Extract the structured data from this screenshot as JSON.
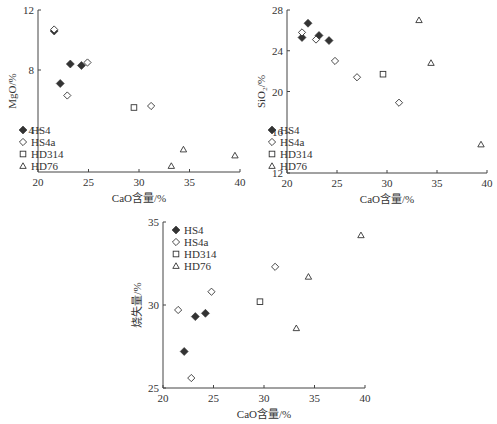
{
  "chart_data": [
    {
      "type": "scatter",
      "id": "mgo",
      "xlabel": "CaO含量/%",
      "ylabel": "MgO/%",
      "xlim": [
        20,
        40
      ],
      "ylim": [
        1.2,
        12
      ],
      "xticks": [
        20,
        25,
        30,
        35,
        40
      ],
      "yticks": [
        4,
        8,
        12
      ],
      "legend_position": "lower-left",
      "series": [
        {
          "name": "HS4",
          "marker": "filled-diamond",
          "points": [
            [
              21.6,
              10.6
            ],
            [
              22.2,
              7.1
            ],
            [
              23.2,
              8.4
            ],
            [
              24.3,
              8.3
            ]
          ]
        },
        {
          "name": "HS4a",
          "marker": "open-diamond",
          "points": [
            [
              21.6,
              10.7
            ],
            [
              22.9,
              6.3
            ],
            [
              24.9,
              8.5
            ],
            [
              31.2,
              5.6
            ]
          ]
        },
        {
          "name": "HD314",
          "marker": "open-square",
          "points": [
            [
              29.5,
              5.5
            ]
          ]
        },
        {
          "name": "HD76",
          "marker": "open-triangle",
          "points": [
            [
              33.2,
              1.6
            ],
            [
              34.4,
              2.7
            ],
            [
              39.5,
              2.3
            ]
          ]
        }
      ]
    },
    {
      "type": "scatter",
      "id": "sio2",
      "xlabel": "CaO含量/%",
      "ylabel": "SiO₂/%",
      "xlim": [
        20,
        40
      ],
      "ylim": [
        12,
        28
      ],
      "xticks": [
        20,
        25,
        30,
        35,
        40
      ],
      "yticks": [
        12,
        16,
        20,
        24,
        28
      ],
      "legend_position": "lower-left",
      "series": [
        {
          "name": "HS4",
          "marker": "filled-diamond",
          "points": [
            [
              21.5,
              25.3
            ],
            [
              22.1,
              26.7
            ],
            [
              23.2,
              25.5
            ],
            [
              24.2,
              25.0
            ]
          ]
        },
        {
          "name": "HS4a",
          "marker": "open-diamond",
          "points": [
            [
              21.5,
              25.8
            ],
            [
              22.9,
              25.1
            ],
            [
              24.8,
              23.0
            ],
            [
              27.0,
              21.4
            ],
            [
              31.2,
              18.9
            ]
          ]
        },
        {
          "name": "HD314",
          "marker": "open-square",
          "points": [
            [
              29.6,
              21.7
            ]
          ]
        },
        {
          "name": "HD76",
          "marker": "open-triangle",
          "points": [
            [
              33.2,
              27.0
            ],
            [
              34.4,
              22.8
            ],
            [
              39.4,
              14.8
            ]
          ]
        }
      ]
    },
    {
      "type": "scatter",
      "id": "loi",
      "xlabel": "CaO含量/%",
      "ylabel": "烧失量/%",
      "xlim": [
        20,
        40
      ],
      "ylim": [
        25,
        35
      ],
      "xticks": [
        20,
        25,
        30,
        35,
        40
      ],
      "yticks": [
        25,
        30,
        35
      ],
      "legend_position": "upper-left",
      "series": [
        {
          "name": "HS4",
          "marker": "filled-diamond",
          "points": [
            [
              22.1,
              27.2
            ],
            [
              23.2,
              29.3
            ],
            [
              24.2,
              29.5
            ]
          ]
        },
        {
          "name": "HS4a",
          "marker": "open-diamond",
          "points": [
            [
              21.5,
              29.7
            ],
            [
              22.8,
              25.6
            ],
            [
              24.8,
              30.8
            ],
            [
              31.1,
              32.3
            ]
          ]
        },
        {
          "name": "HD314",
          "marker": "open-square",
          "points": [
            [
              29.6,
              30.2
            ]
          ]
        },
        {
          "name": "HD76",
          "marker": "open-triangle",
          "points": [
            [
              33.2,
              28.6
            ],
            [
              34.4,
              31.7
            ],
            [
              39.6,
              34.2
            ]
          ]
        }
      ]
    }
  ],
  "legend": {
    "items": [
      {
        "label": "HS4",
        "marker": "filled-diamond"
      },
      {
        "label": "HS4a",
        "marker": "open-diamond"
      },
      {
        "label": "HD314",
        "marker": "open-square"
      },
      {
        "label": "HD76",
        "marker": "open-triangle"
      }
    ]
  },
  "colors": {
    "axis": "#444444",
    "marker": "#333333",
    "background": "#ffffff"
  }
}
